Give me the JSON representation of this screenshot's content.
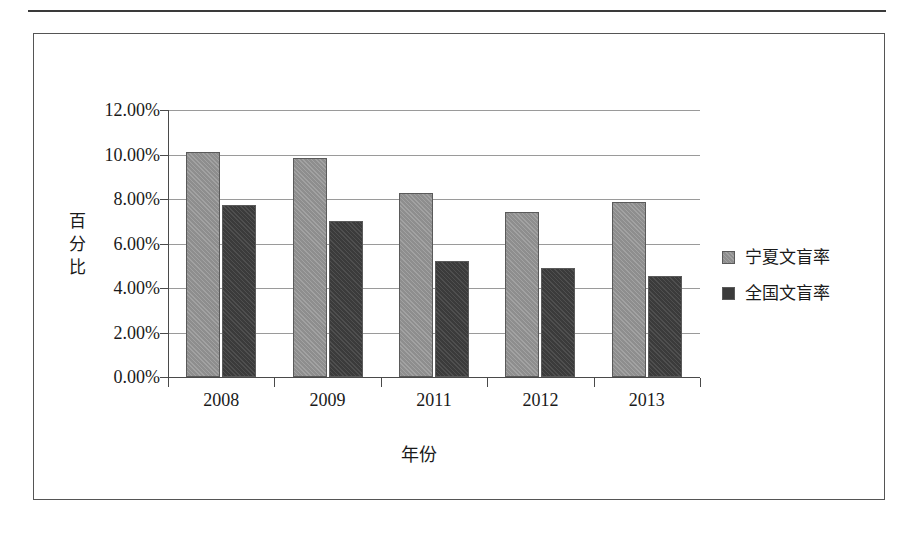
{
  "chart_data": {
    "type": "bar",
    "title": "",
    "xlabel": "年份",
    "ylabel": "百分比",
    "categories": [
      "2008",
      "2009",
      "2011",
      "2012",
      "2013"
    ],
    "series": [
      {
        "name": "宁夏文盲率",
        "color": "#8e8e8e",
        "values": [
          10.1,
          9.85,
          8.25,
          7.4,
          7.85
        ]
      },
      {
        "name": "全国文盲率",
        "color": "#3b3b3b",
        "values": [
          7.75,
          7.0,
          5.2,
          4.9,
          4.55
        ]
      }
    ],
    "ylim": [
      0,
      12
    ],
    "ytick_values": [
      0,
      2,
      4,
      6,
      8,
      10,
      12
    ],
    "ytick_labels": [
      "0.00%",
      "2.00%",
      "4.00%",
      "6.00%",
      "8.00%",
      "10.00%",
      "12.00%"
    ],
    "grid": true,
    "legend_position": "right",
    "value_format": "percent"
  },
  "axes": {
    "y_title_chars": [
      "百",
      "分",
      "比"
    ],
    "x_title": "年份"
  },
  "legend": {
    "items": [
      {
        "label": "宁夏文盲率",
        "swatch": "light-gray-swatch"
      },
      {
        "label": "全国文盲率",
        "swatch": "dark-gray-swatch"
      }
    ]
  }
}
